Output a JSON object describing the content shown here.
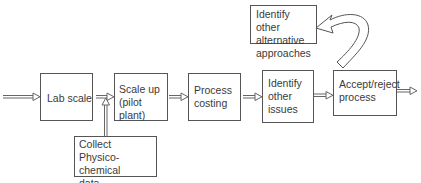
{
  "diagram": {
    "type": "process-flow",
    "nodes": [
      {
        "id": "lab_scale",
        "label": "Lab scale"
      },
      {
        "id": "scale_up",
        "label": "Scale up\n(pilot plant)"
      },
      {
        "id": "process_costing",
        "label": "Process\ncosting"
      },
      {
        "id": "identify_issues",
        "label": "Identify\nother\nissues"
      },
      {
        "id": "accept_reject",
        "label": "Accept/reject\nprocess"
      },
      {
        "id": "alternatives",
        "label": "Identify other\nalternative\napproaches"
      },
      {
        "id": "collect_data",
        "label": "Collect\nPhysico-chemical\ndata"
      }
    ],
    "edges": [
      {
        "from": "input",
        "to": "lab_scale"
      },
      {
        "from": "lab_scale",
        "to": "scale_up"
      },
      {
        "from": "collect_data",
        "to": "scale_up"
      },
      {
        "from": "scale_up",
        "to": "process_costing"
      },
      {
        "from": "process_costing",
        "to": "identify_issues"
      },
      {
        "from": "identify_issues",
        "to": "accept_reject"
      },
      {
        "from": "accept_reject",
        "to": "output"
      },
      {
        "from": "accept_reject",
        "to": "alternatives",
        "style": "curved"
      }
    ]
  }
}
